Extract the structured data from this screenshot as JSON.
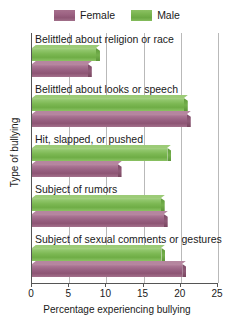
{
  "legend": {
    "entries": [
      {
        "label": "Female",
        "swatch": "female-swatch",
        "color": "#9d6383"
      },
      {
        "label": "Male",
        "swatch": "male-swatch",
        "color": "#79b44f"
      }
    ]
  },
  "axis": {
    "x_label": "Percentage experiencing bullying",
    "y_label": "Type of bullying",
    "x_ticks": [
      "0",
      "5",
      "10",
      "15",
      "20",
      "25"
    ]
  },
  "chart_data": {
    "type": "bar",
    "orientation": "horizontal",
    "title": "",
    "xlabel": "Percentage experiencing bullying",
    "ylabel": "Type of bullying",
    "xlim": [
      0,
      25
    ],
    "xticks": [
      0,
      5,
      10,
      15,
      20,
      25
    ],
    "grid": true,
    "legend_position": "top-center",
    "categories": [
      "Belittled about religion or race",
      "Belittled about looks or speech",
      "Hit, slapped, or pushed",
      "Subject of rumors",
      "Subject of sexual comments or gestures"
    ],
    "series": [
      {
        "name": "Male",
        "color": "#79b44f",
        "values": [
          8.6,
          20.4,
          18.2,
          17.3,
          17.4
        ]
      },
      {
        "name": "Female",
        "color": "#9d6383",
        "values": [
          7.5,
          20.8,
          11.5,
          17.7,
          20.2
        ]
      }
    ]
  }
}
